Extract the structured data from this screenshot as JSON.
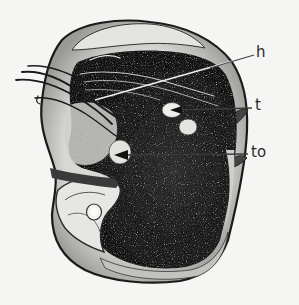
{
  "figure": {
    "background_color": "#f5f5f3",
    "ink_color": "#1c1c1c",
    "labels": [
      {
        "id": "h",
        "text": "h",
        "x": 256,
        "y": 45,
        "pointer_from": [
          254,
          55
        ],
        "pointer_to": [
          95,
          100
        ],
        "pointer_color": "#efefef",
        "arrowhead": false
      },
      {
        "id": "t",
        "text": "t",
        "x": 255,
        "y": 98,
        "pointer_from": [
          252,
          108
        ],
        "pointer_to": [
          178,
          110
        ],
        "pointer_color": "#2a2a2a",
        "arrowhead": true
      },
      {
        "id": "to",
        "text": "to",
        "x": 251,
        "y": 145,
        "pointer_from": [
          248,
          154
        ],
        "pointer_to": [
          122,
          155
        ],
        "pointer_color": "#2a2a2a",
        "arrowhead": true
      }
    ]
  }
}
